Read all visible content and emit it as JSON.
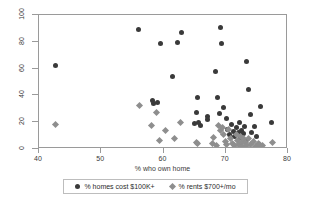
{
  "chart_data": {
    "type": "scatter",
    "title": "",
    "xlabel": "% who own home",
    "ylabel": "",
    "xlim": [
      40,
      80
    ],
    "ylim": [
      0,
      100
    ],
    "xticks": [
      40,
      50,
      60,
      70,
      80
    ],
    "yticks": [
      0,
      20,
      40,
      60,
      80,
      100
    ],
    "grid": false,
    "legend_position": "bottom",
    "series": [
      {
        "name": "% homes cost $100K+",
        "marker": "circle",
        "color": "#3a3a3a",
        "points": [
          [
            42.6,
            62.0
          ],
          [
            56.0,
            89.0
          ],
          [
            58.2,
            36.5
          ],
          [
            58.4,
            34.0
          ],
          [
            59.1,
            34.5
          ],
          [
            59.5,
            78.5
          ],
          [
            61.5,
            54.0
          ],
          [
            62.3,
            79.5
          ],
          [
            62.9,
            87.0
          ],
          [
            64.9,
            19.0
          ],
          [
            65.3,
            27.5
          ],
          [
            65.4,
            38.5
          ],
          [
            65.6,
            19.5
          ],
          [
            66.0,
            17.5
          ],
          [
            67.0,
            24.0
          ],
          [
            67.1,
            22.0
          ],
          [
            68.3,
            57.5
          ],
          [
            68.6,
            38.5
          ],
          [
            69.0,
            26.5
          ],
          [
            69.2,
            91.0
          ],
          [
            69.3,
            78.5
          ],
          [
            69.6,
            31.0
          ],
          [
            70.1,
            22.5
          ],
          [
            70.3,
            14.5
          ],
          [
            70.6,
            11.0
          ],
          [
            71.0,
            18.0
          ],
          [
            71.2,
            13.0
          ],
          [
            71.4,
            9.0
          ],
          [
            71.8,
            16.0
          ],
          [
            72.0,
            12.0
          ],
          [
            72.2,
            20.0
          ],
          [
            72.4,
            8.5
          ],
          [
            72.6,
            14.0
          ],
          [
            72.8,
            11.5
          ],
          [
            73.0,
            16.5
          ],
          [
            73.2,
            6.5
          ],
          [
            73.3,
            65.0
          ],
          [
            73.6,
            44.5
          ],
          [
            73.9,
            25.5
          ],
          [
            74.2,
            12.5
          ],
          [
            74.6,
            17.0
          ],
          [
            75.0,
            9.5
          ],
          [
            75.6,
            31.5
          ],
          [
            77.4,
            19.5
          ]
        ]
      },
      {
        "name": "% rents $700+/mo",
        "marker": "diamond",
        "color": "#8e8e8e",
        "points": [
          [
            42.6,
            18.5
          ],
          [
            56.1,
            32.5
          ],
          [
            58.0,
            17.5
          ],
          [
            58.9,
            27.5
          ],
          [
            59.4,
            6.5
          ],
          [
            60.3,
            14.0
          ],
          [
            61.7,
            7.5
          ],
          [
            62.7,
            20.0
          ],
          [
            65.3,
            4.5
          ],
          [
            65.5,
            4.0
          ],
          [
            67.8,
            4.0
          ],
          [
            68.1,
            8.5
          ],
          [
            68.5,
            2.5
          ],
          [
            68.9,
            17.5
          ],
          [
            69.2,
            13.5
          ],
          [
            69.5,
            16.0
          ],
          [
            69.7,
            10.5
          ],
          [
            70.0,
            5.5
          ],
          [
            70.2,
            3.0
          ],
          [
            70.5,
            14.5
          ],
          [
            70.8,
            8.0
          ],
          [
            71.1,
            4.0
          ],
          [
            71.4,
            2.5
          ],
          [
            71.7,
            11.0
          ],
          [
            71.9,
            6.5
          ],
          [
            72.1,
            3.5
          ],
          [
            72.3,
            9.5
          ],
          [
            72.5,
            5.0
          ],
          [
            72.7,
            2.0
          ],
          [
            72.9,
            7.5
          ],
          [
            73.1,
            4.5
          ],
          [
            73.4,
            2.5
          ],
          [
            73.7,
            8.0
          ],
          [
            74.0,
            3.0
          ],
          [
            74.4,
            5.5
          ],
          [
            74.8,
            2.0
          ],
          [
            75.2,
            4.0
          ],
          [
            75.5,
            3.0
          ],
          [
            75.9,
            2.5
          ],
          [
            77.5,
            5.0
          ]
        ]
      }
    ]
  },
  "legend": {
    "entries": [
      {
        "label": "% homes cost $100K+"
      },
      {
        "label": "% rents $700+/mo"
      }
    ]
  }
}
